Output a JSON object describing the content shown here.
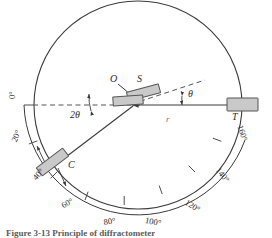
{
  "figure": {
    "caption": "Figure  3-13   Principle  of  diffractometer",
    "colors": {
      "line": "#3a3a3a",
      "dashed": "#555555",
      "block_fill": "#c9c9c9",
      "block_stroke": "#555555",
      "text": "#2b2b2b",
      "background": "#ffffff"
    }
  },
  "geometry": {
    "center_x": 138,
    "center_y": 105,
    "circle_radius": 104,
    "scale_radius": 114,
    "theta_deg": 12,
    "two_theta_deg": 24
  },
  "components": [
    {
      "id": "O",
      "label": "O",
      "name": "specimen-axis",
      "kind": "point-label"
    },
    {
      "id": "S",
      "label": "S",
      "name": "specimen",
      "kind": "block"
    },
    {
      "id": "C",
      "label": "C",
      "name": "counter-detector",
      "kind": "block"
    },
    {
      "id": "T",
      "label": "T",
      "name": "x-ray-tube",
      "kind": "block"
    }
  ],
  "angle_labels": [
    {
      "id": "theta",
      "text": "θ",
      "name": "theta-angle-label"
    },
    {
      "id": "two_theta",
      "text": "2θ",
      "name": "two-theta-angle-label"
    },
    {
      "id": "radius",
      "text": "r",
      "name": "radius-label"
    }
  ],
  "scale": {
    "name": "angle-scale",
    "unit": "°",
    "ticks": [
      {
        "value": 0,
        "label": "0°",
        "angle_deg": 0
      },
      {
        "value": 20,
        "label": "20°",
        "angle_deg": 20
      },
      {
        "value": 40,
        "label": "40°",
        "angle_deg": 40
      },
      {
        "value": 60,
        "label": "60°",
        "angle_deg": 60
      },
      {
        "value": 80,
        "label": "80°",
        "angle_deg": 80
      },
      {
        "value": 100,
        "label": "100°",
        "angle_deg": 100
      },
      {
        "value": 120,
        "label": "120°",
        "angle_deg": 120
      },
      {
        "value": 140,
        "label": "140°",
        "angle_deg": 140
      },
      {
        "value": 160,
        "label": "160°",
        "angle_deg": 160
      }
    ]
  },
  "labels": {
    "O": "O",
    "S": "S",
    "C": "C",
    "T": "T",
    "theta": "θ",
    "two_theta": "2θ",
    "r": "r",
    "deg0": "0°",
    "deg20": "20°",
    "deg40": "40°",
    "deg60": "60°",
    "deg80": "80°",
    "deg100": "100°",
    "deg120": "120°",
    "deg140": "140°",
    "deg160": "160°"
  }
}
